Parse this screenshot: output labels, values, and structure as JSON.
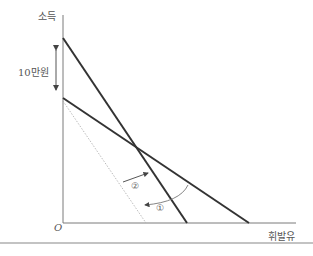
{
  "diagram": {
    "y_axis_label": "소득",
    "x_axis_label": "휘발유",
    "origin_label": "O",
    "interval_label": "10만원",
    "markers": [
      "②",
      "①"
    ],
    "colors": {
      "axis": "#7a7a7a",
      "budget_line": "#333333",
      "dotted_line": "#aaaaaa",
      "arrow": "#444444",
      "rule": "#888888"
    }
  }
}
